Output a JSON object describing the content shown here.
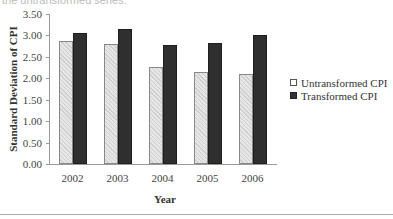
{
  "caption_fragment": "the untransformed series.",
  "chart_data": {
    "type": "bar",
    "title": "",
    "xlabel": "Year",
    "ylabel": "Standard Deviation of CPI",
    "categories": [
      "2002",
      "2003",
      "2004",
      "2005",
      "2006"
    ],
    "series": [
      {
        "name": "Untransformed CPI",
        "values": [
          2.88,
          2.8,
          2.26,
          2.14,
          2.1
        ],
        "color": "#d9d9d9"
      },
      {
        "name": "Transformed CPI",
        "values": [
          3.06,
          3.15,
          2.77,
          2.83,
          3.01
        ],
        "color": "#2f2f2f"
      }
    ],
    "ylim": [
      0,
      3.5
    ],
    "yticks": [
      "0.00",
      "0.50",
      "1.00",
      "1.50",
      "2.00",
      "2.50",
      "3.00",
      "3.50"
    ],
    "grid": false,
    "legend_position": "right"
  }
}
